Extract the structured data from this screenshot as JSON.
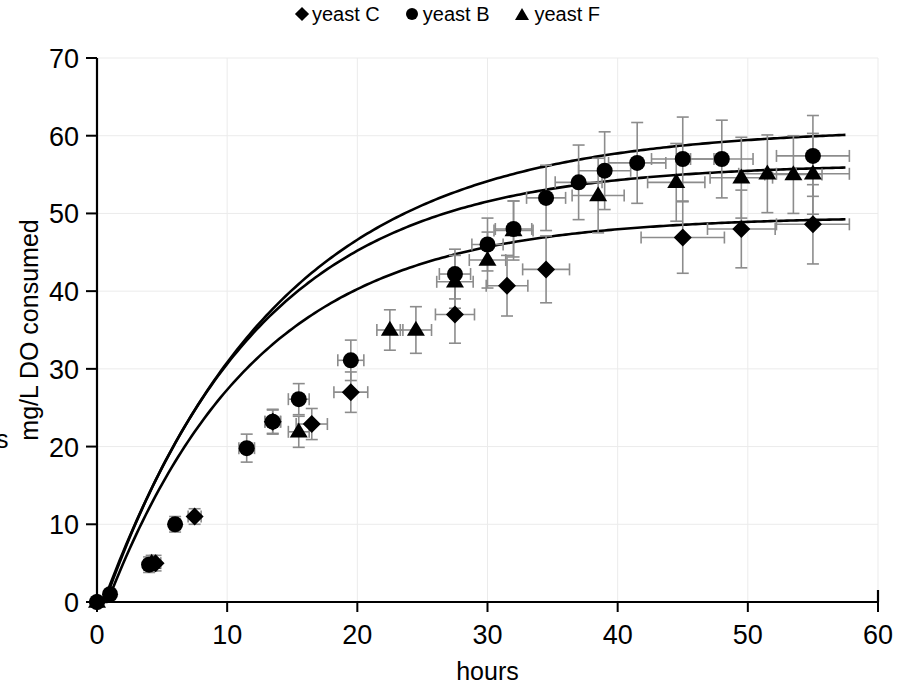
{
  "legend": {
    "position": "top-center",
    "entries": [
      {
        "label": "yeast C",
        "marker": "diamond-icon"
      },
      {
        "label": "yeast B",
        "marker": "circle-icon"
      },
      {
        "label": "yeast F",
        "marker": "triangle-icon"
      }
    ]
  },
  "axes": {
    "x": {
      "label": "hours",
      "min": 0,
      "max": 60,
      "ticks": [
        0,
        10,
        20,
        30,
        40,
        50,
        60
      ]
    },
    "y": {
      "label": "mg/L DO consumed",
      "min": 0,
      "max": 70,
      "ticks": [
        0,
        10,
        20,
        30,
        40,
        50,
        60,
        70
      ]
    }
  },
  "chart_data": {
    "type": "scatter",
    "title": "",
    "xlabel": "hours",
    "ylabel": "mg/L DO consumed",
    "xlim": [
      0,
      60
    ],
    "ylim": [
      0,
      70
    ],
    "xticks": [
      0,
      10,
      20,
      30,
      40,
      50,
      60
    ],
    "yticks": [
      0,
      10,
      20,
      30,
      40,
      50,
      60,
      70
    ],
    "grid": true,
    "legend_position": "top-center",
    "error_bars": "both x and y, symmetric, gray",
    "fit_curves": "saturating (Monod-type) fitted line per series",
    "series": [
      {
        "name": "yeast C",
        "marker": "diamond",
        "points": [
          {
            "x": 0,
            "y": 0,
            "xerr": 0.0,
            "yerr": 0.3
          },
          {
            "x": 4.5,
            "y": 5.0,
            "xerr": 0.4,
            "yerr": 1.0
          },
          {
            "x": 7.5,
            "y": 11.0,
            "xerr": 0.5,
            "yerr": 1.0
          },
          {
            "x": 13.5,
            "y": 23.2,
            "xerr": 0.6,
            "yerr": 1.5
          },
          {
            "x": 16.5,
            "y": 22.9,
            "xerr": 1.2,
            "yerr": 2.0
          },
          {
            "x": 19.5,
            "y": 27.0,
            "xerr": 1.3,
            "yerr": 2.6
          },
          {
            "x": 27.5,
            "y": 37.0,
            "xerr": 1.5,
            "yerr": 3.7
          },
          {
            "x": 31.5,
            "y": 40.7,
            "xerr": 1.6,
            "yerr": 3.9
          },
          {
            "x": 34.5,
            "y": 42.8,
            "xerr": 1.8,
            "yerr": 4.3
          },
          {
            "x": 45.0,
            "y": 46.9,
            "xerr": 3.2,
            "yerr": 4.6
          },
          {
            "x": 49.5,
            "y": 48.0,
            "xerr": 2.6,
            "yerr": 5.0
          },
          {
            "x": 55.0,
            "y": 48.6,
            "xerr": 2.8,
            "yerr": 5.1
          }
        ],
        "fit": {
          "ymax": 49.6,
          "k": 11.5,
          "lag": 0.8,
          "xmax": 57.5
        }
      },
      {
        "name": "yeast B",
        "marker": "circle",
        "points": [
          {
            "x": 0,
            "y": 0,
            "xerr": 0.0,
            "yerr": 0.3
          },
          {
            "x": 1.0,
            "y": 1.0,
            "xerr": 0.2,
            "yerr": 0.5
          },
          {
            "x": 4.0,
            "y": 4.8,
            "xerr": 0.4,
            "yerr": 1.0
          },
          {
            "x": 6.0,
            "y": 10.0,
            "xerr": 0.4,
            "yerr": 1.0
          },
          {
            "x": 11.5,
            "y": 19.8,
            "xerr": 0.6,
            "yerr": 1.8
          },
          {
            "x": 13.5,
            "y": 23.2,
            "xerr": 0.6,
            "yerr": 1.6
          },
          {
            "x": 15.5,
            "y": 26.1,
            "xerr": 0.8,
            "yerr": 2.0
          },
          {
            "x": 19.5,
            "y": 31.1,
            "xerr": 1.0,
            "yerr": 2.6
          },
          {
            "x": 27.5,
            "y": 42.2,
            "xerr": 1.2,
            "yerr": 3.2
          },
          {
            "x": 30.0,
            "y": 46.0,
            "xerr": 1.2,
            "yerr": 3.4
          },
          {
            "x": 32.0,
            "y": 48.0,
            "xerr": 1.4,
            "yerr": 3.6
          },
          {
            "x": 34.5,
            "y": 52.0,
            "xerr": 1.5,
            "yerr": 4.2
          },
          {
            "x": 37.0,
            "y": 54.0,
            "xerr": 1.8,
            "yerr": 4.8
          },
          {
            "x": 39.0,
            "y": 55.5,
            "xerr": 2.0,
            "yerr": 5.0
          },
          {
            "x": 41.5,
            "y": 56.5,
            "xerr": 2.2,
            "yerr": 5.2
          },
          {
            "x": 45.0,
            "y": 57.0,
            "xerr": 2.4,
            "yerr": 5.4
          },
          {
            "x": 48.0,
            "y": 57.0,
            "xerr": 2.4,
            "yerr": 5.0
          },
          {
            "x": 55.0,
            "y": 57.4,
            "xerr": 2.8,
            "yerr": 5.2
          }
        ],
        "fit": {
          "ymax": 61.0,
          "k": 13.5,
          "lag": 0.5,
          "xmax": 57.5
        }
      },
      {
        "name": "yeast F",
        "marker": "triangle",
        "points": [
          {
            "x": 0,
            "y": 0,
            "xerr": 0.0,
            "yerr": 0.3
          },
          {
            "x": 4.2,
            "y": 5.0,
            "xerr": 0.4,
            "yerr": 1.0
          },
          {
            "x": 15.5,
            "y": 21.9,
            "xerr": 0.8,
            "yerr": 2.0
          },
          {
            "x": 22.5,
            "y": 35.0,
            "xerr": 1.0,
            "yerr": 2.6
          },
          {
            "x": 24.5,
            "y": 35.0,
            "xerr": 1.2,
            "yerr": 3.0
          },
          {
            "x": 27.5,
            "y": 41.2,
            "xerr": 1.4,
            "yerr": 3.4
          },
          {
            "x": 30.0,
            "y": 44.0,
            "xerr": 1.4,
            "yerr": 3.6
          },
          {
            "x": 32.0,
            "y": 47.8,
            "xerr": 1.5,
            "yerr": 3.8
          },
          {
            "x": 38.5,
            "y": 52.3,
            "xerr": 2.0,
            "yerr": 4.8
          },
          {
            "x": 44.5,
            "y": 54.0,
            "xerr": 2.2,
            "yerr": 5.0
          },
          {
            "x": 49.5,
            "y": 54.6,
            "xerr": 2.4,
            "yerr": 5.2
          },
          {
            "x": 51.5,
            "y": 55.1,
            "xerr": 2.2,
            "yerr": 5.0
          },
          {
            "x": 53.5,
            "y": 55.0,
            "xerr": 2.2,
            "yerr": 5.0
          },
          {
            "x": 55.0,
            "y": 55.1,
            "xerr": 2.8,
            "yerr": 5.2
          }
        ],
        "fit": {
          "ymax": 56.4,
          "k": 12.0,
          "lag": 0.6,
          "xmax": 57.5
        }
      }
    ]
  }
}
